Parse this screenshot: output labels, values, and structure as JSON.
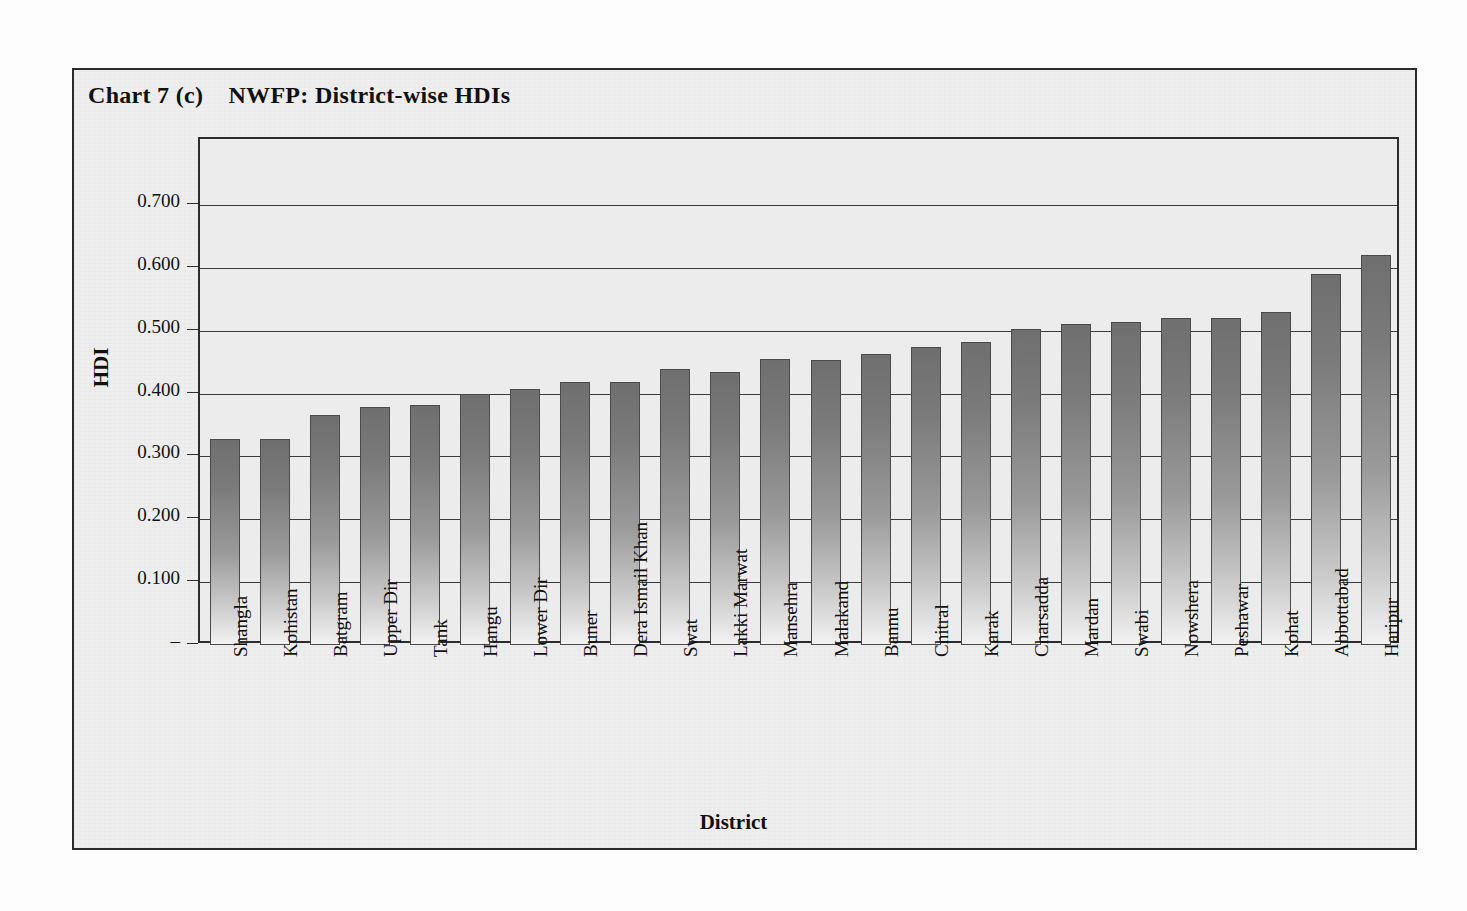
{
  "chart_title": "Chart 7 (c)    NWFP: District-wise HDIs",
  "axis": {
    "y_title": "HDI",
    "x_title": "District",
    "y_tick_labels": [
      "0.700",
      "0.600",
      "0.500",
      "0.400",
      "0.300",
      "0.200",
      "0.100",
      "–"
    ],
    "y_tick_values": [
      0.7,
      0.6,
      0.5,
      0.4,
      0.3,
      0.2,
      0.1,
      0.0
    ]
  },
  "chart_data": {
    "type": "bar",
    "title": "Chart 7 (c)    NWFP: District-wise HDIs",
    "xlabel": "District",
    "ylabel": "HDI",
    "ylim": [
      0,
      0.75
    ],
    "grid": true,
    "legend": null,
    "ytick_labels": [
      "–",
      "0.100",
      "0.200",
      "0.300",
      "0.400",
      "0.500",
      "0.600",
      "0.700"
    ],
    "categories": [
      "Shangla",
      "Kohistan",
      "Batgram",
      "Upper Dir",
      "Tank",
      "Hangu",
      "Lower Dir",
      "Buner",
      "Dera Ismail Khan",
      "Swat",
      "Lakki Marwat",
      "Mansehra",
      "Malakand",
      "Bannu",
      "Chitral",
      "Karak",
      "Charsadda",
      "Mardan",
      "Swabi",
      "Nowshera",
      "Peshawar",
      "Kohat",
      "Abbottabad",
      "Haripur"
    ],
    "values": [
      0.328,
      0.328,
      0.366,
      0.378,
      0.382,
      0.399,
      0.407,
      0.418,
      0.418,
      0.439,
      0.434,
      0.455,
      0.454,
      0.463,
      0.474,
      0.482,
      0.502,
      0.51,
      0.514,
      0.521,
      0.521,
      0.529,
      0.59,
      0.62
    ]
  },
  "scan_ghost_text": ""
}
